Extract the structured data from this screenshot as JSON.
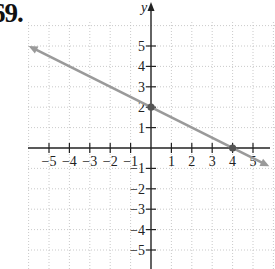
{
  "problem": {
    "number": "69."
  },
  "chart_data": {
    "type": "line",
    "title": "",
    "xlabel": "",
    "ylabel": "y",
    "xlim": [
      -6,
      6
    ],
    "ylim": [
      -6,
      6
    ],
    "grid": true,
    "x_ticks": [
      -5,
      -4,
      -3,
      -2,
      -1,
      1,
      2,
      3,
      4,
      5
    ],
    "y_ticks": [
      5,
      4,
      3,
      2,
      1,
      -1,
      -2,
      -3,
      -4,
      -5
    ],
    "x_tick_labels": [
      "−5",
      "−4",
      "−3",
      "−2",
      "−1",
      "1",
      "2",
      "3",
      "4",
      "5"
    ],
    "y_tick_labels": [
      "5",
      "4",
      "3",
      "2",
      "1",
      "−1",
      "−2",
      "−3",
      "−4",
      "−5"
    ],
    "series": [
      {
        "name": "line",
        "equation": "y = -x/2 + 2",
        "slope": -0.5,
        "intercept": 2,
        "x": [
          -6,
          5.8
        ],
        "y": [
          5,
          -0.9
        ],
        "arrows": "both",
        "color": "#9a9a9a"
      }
    ],
    "highlighted_points": [
      {
        "x": 0,
        "y": 2,
        "label": "y-intercept"
      },
      {
        "x": 4,
        "y": 0,
        "label": "x-intercept"
      }
    ]
  },
  "colors": {
    "axis": "#222222",
    "grid": "#bbbbbb",
    "line": "#9a9a9a",
    "point": "#555555"
  }
}
